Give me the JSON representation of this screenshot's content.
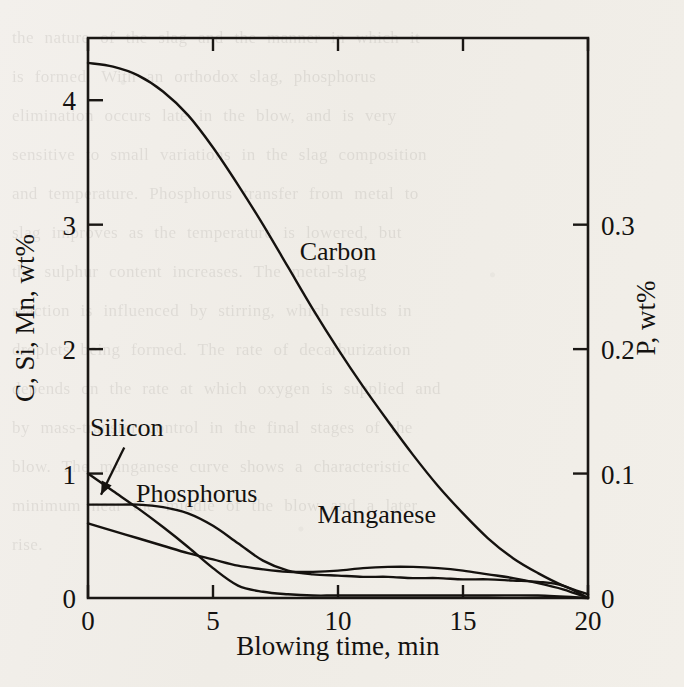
{
  "figure": {
    "kind": "scanned-textbook-figure",
    "background_note": "faint bleed-through text from reverse page"
  },
  "chart_data": {
    "type": "line",
    "title": "",
    "xlabel": "Blowing time, min",
    "ylabel": "C, Si, Mn, wt%",
    "y2label": "P, wt%",
    "xlim": [
      0,
      20
    ],
    "ylim": [
      0,
      4.5
    ],
    "y2lim": [
      0,
      0.45
    ],
    "xticks": [
      "0",
      "5",
      "10",
      "15",
      "20"
    ],
    "xtick_values": [
      0,
      5,
      10,
      15,
      20
    ],
    "yticks": [
      "0",
      "1",
      "2",
      "3",
      "4"
    ],
    "ytick_values": [
      0,
      1,
      2,
      3,
      4
    ],
    "y2ticks": [
      "0",
      "0.1",
      "0.2",
      "0.3"
    ],
    "y2tick_values": [
      0,
      0.1,
      0.2,
      0.3
    ],
    "grid": false,
    "legend": "inline-labels",
    "series": [
      {
        "name": "Carbon",
        "axis": "left",
        "label": "Carbon",
        "label_x": 10.0,
        "label_y": 2.72,
        "x": [
          0,
          1,
          2,
          3,
          4,
          5,
          6,
          7,
          8,
          9,
          10,
          11,
          12,
          13,
          14,
          15,
          16,
          17,
          18,
          19,
          20
        ],
        "y": [
          4.3,
          4.27,
          4.2,
          4.07,
          3.88,
          3.62,
          3.32,
          3.0,
          2.66,
          2.32,
          2.0,
          1.7,
          1.42,
          1.15,
          0.9,
          0.68,
          0.48,
          0.32,
          0.2,
          0.1,
          0.03
        ]
      },
      {
        "name": "Silicon",
        "axis": "left",
        "label": "Silicon",
        "label_x": 1.55,
        "label_y": 1.3,
        "arrow_from_x": 1.45,
        "arrow_from_y": 1.21,
        "arrow_to_x": 0.52,
        "arrow_to_y": 0.83,
        "x": [
          0,
          1,
          2,
          3,
          4,
          5,
          6,
          7,
          8,
          9,
          10,
          12,
          14,
          16,
          18,
          20
        ],
        "y": [
          1.0,
          0.86,
          0.72,
          0.57,
          0.41,
          0.24,
          0.1,
          0.05,
          0.03,
          0.02,
          0.02,
          0.02,
          0.02,
          0.02,
          0.02,
          0.0
        ]
      },
      {
        "name": "Phosphorus",
        "axis": "right",
        "label": "Phosphorus",
        "label_x": 4.35,
        "label_y": 0.77,
        "x": [
          0,
          1,
          2,
          3,
          4,
          5,
          6,
          7,
          8,
          9,
          10,
          11,
          12,
          13,
          14,
          15,
          16,
          17,
          18,
          19,
          20
        ],
        "y_right": [
          0.075,
          0.075,
          0.075,
          0.073,
          0.068,
          0.058,
          0.044,
          0.03,
          0.022,
          0.019,
          0.018,
          0.017,
          0.017,
          0.016,
          0.016,
          0.015,
          0.015,
          0.014,
          0.013,
          0.01,
          0.0
        ],
        "y_left_equiv": [
          0.75,
          0.75,
          0.75,
          0.73,
          0.68,
          0.58,
          0.44,
          0.3,
          0.22,
          0.19,
          0.18,
          0.17,
          0.17,
          0.16,
          0.16,
          0.15,
          0.15,
          0.14,
          0.13,
          0.1,
          0.0
        ]
      },
      {
        "name": "Manganese",
        "axis": "left",
        "label": "Manganese",
        "label_x": 11.55,
        "label_y": 0.6,
        "x": [
          0,
          1,
          2,
          3,
          4,
          5,
          6,
          7,
          8,
          9,
          10,
          11,
          12,
          13,
          14,
          15,
          16,
          17,
          18,
          19,
          20
        ],
        "y": [
          0.6,
          0.54,
          0.48,
          0.42,
          0.36,
          0.31,
          0.26,
          0.23,
          0.21,
          0.21,
          0.22,
          0.24,
          0.25,
          0.25,
          0.24,
          0.22,
          0.19,
          0.16,
          0.12,
          0.07,
          0.0
        ]
      }
    ]
  },
  "ghost_text": "the nature of the slag and the manner in which it\nis formed. With an orthodox slag, phosphorus\nelimination occurs late in the blow, and is very\nsensitive to small variations in the slag composition\nand temperature. Phosphorus transfer from metal to\nslag improves as the temperature is lowered, but\nthe sulphur content increases. The metal-slag\nreaction is influenced by stirring, which results in\ndroplets being formed. The rate of decarburization\ndepends on the rate at which oxygen is supplied and\nby mass-transfer control in the final stages of the\nblow. The manganese curve shows a characteristic\nminimum near the middle of the blow and a later\nrise."
}
